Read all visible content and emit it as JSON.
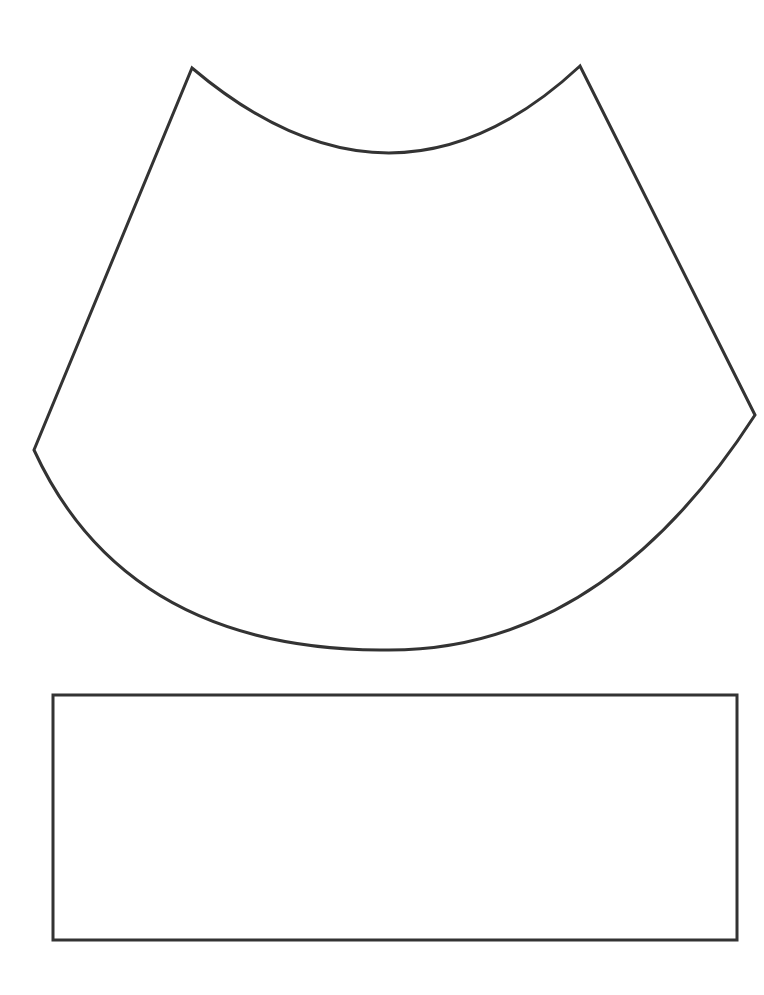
{
  "diagram": {
    "type": "cone-net-template",
    "background": "#ffffff",
    "stroke_color": "#333333",
    "stroke_width": 3,
    "shapes": [
      {
        "id": "annular-sector",
        "kind": "annular-sector",
        "vertices": {
          "top_left": [
            192,
            68
          ],
          "top_right": [
            580,
            66
          ],
          "left": [
            34,
            450
          ],
          "right": [
            755,
            415
          ]
        },
        "inner_arc_lowest_point": [
          390,
          153
        ],
        "outer_arc_lowest_point": [
          380,
          650
        ]
      },
      {
        "id": "rectangle",
        "kind": "rectangle",
        "x": 53,
        "y": 695,
        "width": 684,
        "height": 245
      }
    ]
  }
}
